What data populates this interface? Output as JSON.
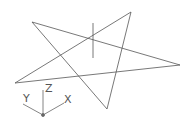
{
  "viewport": {
    "background": "#ffffff",
    "line_color": "#555555"
  },
  "drawing": {
    "shape": "star",
    "vertices": [
      [
        32,
        22
      ],
      [
        180,
        65
      ],
      [
        15,
        83
      ],
      [
        131,
        12
      ],
      [
        107,
        109
      ]
    ],
    "cursor_line": {
      "x": 93,
      "y1": 23,
      "y2": 58
    }
  },
  "ucs_icon": {
    "x_label": "X",
    "y_label": "Y",
    "z_label": "Z"
  }
}
